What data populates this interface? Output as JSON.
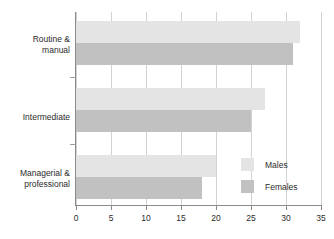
{
  "chart_data": {
    "type": "bar",
    "orientation": "horizontal",
    "title": "",
    "subtitle": "",
    "xlabel": "",
    "ylabel": "",
    "xlim": [
      0,
      35
    ],
    "xticks": [
      "0",
      "5",
      "10",
      "15",
      "20",
      "25",
      "30",
      "35"
    ],
    "xtick_values": [
      0,
      5,
      10,
      15,
      20,
      25,
      30,
      35
    ],
    "grid": true,
    "grid_axis": "x",
    "legend_position": "inside-right",
    "categories": [
      "Routine & manual",
      "Intermediate",
      "Managerial & professional"
    ],
    "category_lines": [
      [
        "Routine &",
        "manual"
      ],
      [
        "Intermediate"
      ],
      [
        "Managerial &",
        "professional"
      ]
    ],
    "series": [
      {
        "name": "Males",
        "color": "#e4e4e4",
        "values": [
          32,
          27,
          20
        ]
      },
      {
        "name": "Females",
        "color": "#c1c1c1",
        "values": [
          31,
          25,
          18
        ]
      }
    ]
  },
  "legend": {
    "items": [
      {
        "label": "Males",
        "swatch": "males"
      },
      {
        "label": "Females",
        "swatch": "females"
      }
    ]
  },
  "colors": {
    "males": "#e4e4e4",
    "females": "#c1c1c1",
    "axis": "#8a8a8a",
    "grid": "#d2d2d2",
    "text": "#2b2b2b",
    "background": "#ffffff"
  }
}
